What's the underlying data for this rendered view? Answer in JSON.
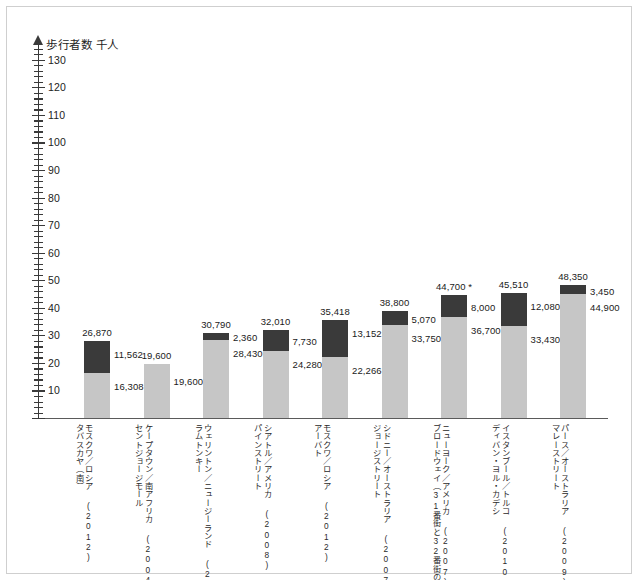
{
  "chart_data": {
    "type": "bar",
    "stacked": true,
    "title": "",
    "ylabel": "歩行者数 千人",
    "xlabel": "",
    "ylim": [
      0,
      135
    ],
    "ytick_step": 10,
    "yminor_step": 2,
    "ytick_labels": [
      "10",
      "20",
      "30",
      "40",
      "50",
      "60",
      "70",
      "80",
      "90",
      "100",
      "110",
      "120",
      "130"
    ],
    "grid": false,
    "legend": "none",
    "colors": {
      "top_segment": "#3a3a3a",
      "bottom_segment": "#c6c6c6",
      "axis": "#3a3a3a",
      "text": "#1a1a1a"
    },
    "series": [
      {
        "name": "上段",
        "values": [
          11562,
          0,
          2360,
          7730,
          13152,
          5070,
          8000,
          12080,
          3450
        ]
      },
      {
        "name": "下段",
        "values": [
          16308,
          19600,
          28430,
          24280,
          22266,
          33750,
          36700,
          33430,
          44900
        ]
      }
    ],
    "categories": [
      "モスクワ／ロシア (2012)",
      "ケープタウン／南アフリカ (2004)",
      "ウェリントン／ニュージーランド (2004)",
      "シアトル／アメリカ (2008)",
      "モスクワ／ロシア (2012)",
      "シドニー／オーストラリア (2007)",
      "ニューヨーク／アメリカ (2007)",
      "イスタンブール／トルコ (2010-11)",
      "パース／オーストラリア (2009)"
    ],
    "bars": [
      {
        "street": "タバスカヤ（南）",
        "city": "モスクワ／ロシア (2012)",
        "total_label": "26,870",
        "top_label": "11,562",
        "bottom_label": "16,308",
        "total": 26870,
        "top": 11562,
        "bottom": 16308,
        "footnote": false
      },
      {
        "street": "セントジョージモール",
        "city": "ケープタウン／南アフリカ (2004)",
        "total_label": "19,600",
        "top_label": "",
        "bottom_label": "19,600",
        "total": 19600,
        "top": 0,
        "bottom": 19600,
        "footnote": false
      },
      {
        "street": "ラムトンキー",
        "city": "ウェリントン／ニュージーランド (2004)",
        "total_label": "30,790",
        "top_label": "2,360",
        "bottom_label": "28,430",
        "total": 30790,
        "top": 2360,
        "bottom": 28430,
        "footnote": false
      },
      {
        "street": "パインストリート",
        "city": "シアトル／アメリカ (2008)",
        "total_label": "32,010",
        "top_label": "7,730",
        "bottom_label": "24,280",
        "total": 32010,
        "top": 7730,
        "bottom": 24280,
        "footnote": false
      },
      {
        "street": "アーバト",
        "city": "モスクワ／ロシア (2012)",
        "total_label": "35,418",
        "top_label": "13,152",
        "bottom_label": "22,266",
        "total": 35418,
        "top": 13152,
        "bottom": 22266,
        "footnote": false
      },
      {
        "street": "ジョージストリート",
        "city": "シドニー／オーストラリア (2007)",
        "total_label": "38,800",
        "top_label": "5,070",
        "bottom_label": "33,750",
        "total": 38800,
        "top": 5070,
        "bottom": 33750,
        "footnote": false
      },
      {
        "street": "ブロードウェイ（31番街と32番街の間）",
        "city": "ニューヨーク／アメリカ (2007)",
        "total_label": "44,700 *",
        "top_label": "8,000",
        "bottom_label": "36,700",
        "total": 44700,
        "top": 8000,
        "bottom": 36700,
        "footnote": true
      },
      {
        "street": "ディバン・ヨル・カデシ",
        "city": "イスタンブール／トルコ (2010-11)",
        "total_label": "45,510",
        "top_label": "12,080",
        "bottom_label": "33,430",
        "total": 45510,
        "top": 12080,
        "bottom": 33430,
        "footnote": false
      },
      {
        "street": "マレーストリート",
        "city": "パース／オーストラリア (2009)",
        "total_label": "48,350",
        "top_label": "3,450",
        "bottom_label": "44,900",
        "total": 48350,
        "top": 3450,
        "bottom": 44900,
        "footnote": false
      }
    ]
  }
}
